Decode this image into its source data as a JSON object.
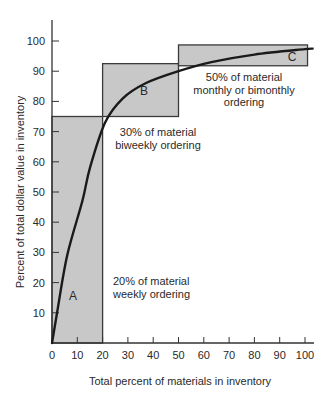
{
  "chart_data": {
    "type": "line",
    "title": "",
    "xlabel": "Total percent of materials in inventory",
    "ylabel": "Percent of total dollar value in inventory",
    "xlim": [
      0,
      103
    ],
    "ylim": [
      0,
      105
    ],
    "x_ticks": [
      0,
      10,
      20,
      30,
      40,
      50,
      60,
      70,
      80,
      90,
      100
    ],
    "x_tick_labels": [
      "0",
      "10",
      "20",
      "30",
      "40",
      "50",
      "60",
      "70",
      "80",
      "90",
      "100"
    ],
    "y_ticks": [
      10,
      20,
      30,
      40,
      50,
      60,
      70,
      80,
      90,
      100
    ],
    "y_tick_labels": [
      "10",
      "20",
      "30",
      "40",
      "50",
      "60",
      "70",
      "80",
      "90",
      "100"
    ],
    "grid": false,
    "legend": null,
    "series": [
      {
        "name": "Cumulative dollar value curve",
        "x": [
          0,
          2,
          6,
          12,
          15,
          21,
          28,
          37,
          50,
          63,
          80,
          100,
          103
        ],
        "y": [
          0,
          10,
          29,
          47,
          58,
          73,
          81,
          86,
          90,
          93,
          95.5,
          97.3,
          97.5
        ]
      }
    ],
    "regions": [
      {
        "label": "A",
        "x": [
          0,
          20
        ],
        "y": [
          0,
          75
        ],
        "annotation": [
          "20% of material",
          "weekly ordering"
        ]
      },
      {
        "label": "B",
        "x": [
          20,
          50
        ],
        "y": [
          75,
          92.5
        ],
        "annotation": [
          "30% of material",
          "biweekly ordering"
        ]
      },
      {
        "label": "C",
        "x": [
          50,
          101
        ],
        "y": [
          91.8,
          98.7
        ],
        "annotation": [
          "50% of material",
          "monthly or bimonthly",
          "ordering"
        ]
      }
    ],
    "colors": {
      "region_fill": "#c8c8c8",
      "line": "#1a1a1a",
      "axis": "#333333"
    }
  }
}
